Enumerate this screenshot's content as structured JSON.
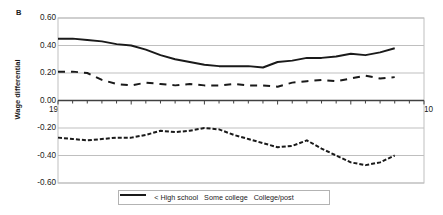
{
  "chart_data": {
    "type": "line",
    "panel_label": "B",
    "title": "",
    "xlabel": "",
    "ylabel": "Wage differential",
    "xlim": [
      1985,
      2010
    ],
    "ylim": [
      -0.6,
      0.6
    ],
    "ytick_labels": [
      "0.60",
      "0.40",
      "0.20",
      "0.00",
      "-0.20",
      "-0.40",
      "-0.60"
    ],
    "ytick_values": [
      0.6,
      0.4,
      0.2,
      0.0,
      -0.2,
      -0.4,
      -0.6
    ],
    "xtick_labels": [
      "1985",
      "1990",
      "1995",
      "2000",
      "2005",
      "2010"
    ],
    "xtick_values": [
      1985,
      1990,
      1995,
      2000,
      2005,
      2010
    ],
    "minor_xtick_interval": 1,
    "grid": "horizontal",
    "legend_position": "bottom-center",
    "x": [
      1985,
      1986,
      1987,
      1988,
      1989,
      1990,
      1991,
      1992,
      1993,
      1994,
      1995,
      1996,
      1997,
      1998,
      1999,
      2000,
      2001,
      2002,
      2003,
      2004,
      2005,
      2006,
      2007,
      2008
    ],
    "series": [
      {
        "name": "< High school",
        "style": "fine-dashed",
        "color": "#1a1a1a",
        "values": [
          -0.27,
          -0.28,
          -0.29,
          -0.28,
          -0.27,
          -0.27,
          -0.25,
          -0.22,
          -0.23,
          -0.22,
          -0.2,
          -0.21,
          -0.25,
          -0.28,
          -0.31,
          -0.34,
          -0.33,
          -0.29,
          -0.35,
          -0.4,
          -0.45,
          -0.47,
          -0.45,
          -0.4
        ]
      },
      {
        "name": "Some college",
        "style": "long-dashed",
        "color": "#1a1a1a",
        "values": [
          0.21,
          0.21,
          0.2,
          0.15,
          0.12,
          0.11,
          0.13,
          0.12,
          0.11,
          0.12,
          0.11,
          0.11,
          0.12,
          0.11,
          0.11,
          0.1,
          0.13,
          0.14,
          0.15,
          0.14,
          0.16,
          0.18,
          0.16,
          0.17
        ]
      },
      {
        "name": "College/post",
        "style": "solid",
        "color": "#1a1a1a",
        "values": [
          0.45,
          0.45,
          0.44,
          0.43,
          0.41,
          0.4,
          0.37,
          0.33,
          0.3,
          0.28,
          0.26,
          0.25,
          0.25,
          0.25,
          0.24,
          0.28,
          0.29,
          0.31,
          0.31,
          0.32,
          0.34,
          0.33,
          0.35,
          0.38
        ]
      }
    ]
  },
  "legend": {
    "items": [
      {
        "label": "< High school"
      },
      {
        "label": "Some college"
      },
      {
        "label": "College/post"
      }
    ]
  }
}
